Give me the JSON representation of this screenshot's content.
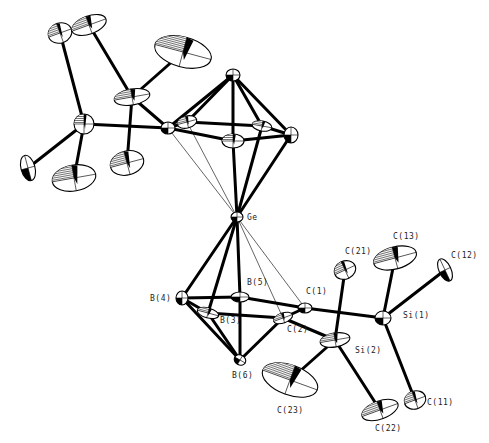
{
  "figure": {
    "title": "",
    "atoms": [
      {
        "id": "Ge",
        "label": "Ge",
        "x": 237,
        "y": 217,
        "rx": 6,
        "ry": 5,
        "rot": 0,
        "lx": 247,
        "ly": 220
      },
      {
        "id": "B4",
        "label": "B(4)",
        "x": 182,
        "y": 298,
        "rx": 6,
        "ry": 7,
        "rot": 0,
        "lx": 150,
        "ly": 301
      },
      {
        "id": "B5",
        "label": "B(5)",
        "x": 240,
        "y": 297,
        "rx": 9,
        "ry": 5,
        "rot": 0,
        "lx": 247,
        "ly": 285
      },
      {
        "id": "B3",
        "label": "B(3)",
        "x": 208,
        "y": 313,
        "rx": 11,
        "ry": 5,
        "rot": 15,
        "lx": 220,
        "ly": 323
      },
      {
        "id": "C1",
        "label": "C(1)",
        "x": 305,
        "y": 308,
        "rx": 7,
        "ry": 5,
        "rot": 0,
        "lx": 306,
        "ly": 294
      },
      {
        "id": "C2",
        "label": "C(2)",
        "x": 283,
        "y": 318,
        "rx": 10,
        "ry": 5,
        "rot": -20,
        "lx": 287,
        "ly": 332
      },
      {
        "id": "B6",
        "label": "B(6)",
        "x": 240,
        "y": 360,
        "rx": 6,
        "ry": 5,
        "rot": 30,
        "lx": 232,
        "ly": 378
      },
      {
        "id": "Si1",
        "label": "Si(1)",
        "x": 383,
        "y": 318,
        "rx": 8,
        "ry": 7,
        "rot": 0,
        "lx": 403,
        "ly": 318
      },
      {
        "id": "Si2",
        "label": "Si(2)",
        "x": 335,
        "y": 340,
        "rx": 15,
        "ry": 7,
        "rot": -10,
        "lx": 355,
        "ly": 353
      },
      {
        "id": "C21",
        "label": "C(21)",
        "x": 345,
        "y": 270,
        "rx": 11,
        "ry": 9,
        "rot": -25,
        "lx": 345,
        "ly": 254
      },
      {
        "id": "C13",
        "label": "C(13)",
        "x": 395,
        "y": 258,
        "rx": 22,
        "ry": 11,
        "rot": -15,
        "lx": 393,
        "ly": 239
      },
      {
        "id": "C12",
        "label": "C(12)",
        "x": 445,
        "y": 270,
        "rx": 6,
        "ry": 12,
        "rot": -25,
        "lx": 451,
        "ly": 258
      },
      {
        "id": "C11",
        "label": "C(11)",
        "x": 415,
        "y": 400,
        "rx": 11,
        "ry": 9,
        "rot": -20,
        "lx": 427,
        "ly": 405
      },
      {
        "id": "C22",
        "label": "C(22)",
        "x": 380,
        "y": 410,
        "rx": 19,
        "ry": 9,
        "rot": -20,
        "lx": 375,
        "ly": 431
      },
      {
        "id": "C23",
        "label": "C(23)",
        "x": 290,
        "y": 380,
        "rx": 29,
        "ry": 15,
        "rot": 20,
        "lx": 277,
        "ly": 413
      }
    ],
    "unlabeled_atoms": [
      {
        "id": "T_apex",
        "x": 233,
        "y": 75,
        "rx": 7,
        "ry": 6,
        "rot": 0
      },
      {
        "id": "T_left",
        "x": 168,
        "y": 128,
        "rx": 7,
        "ry": 6,
        "rot": 0
      },
      {
        "id": "T_backleft",
        "x": 187,
        "y": 122,
        "rx": 10,
        "ry": 6,
        "rot": -15
      },
      {
        "id": "T_front",
        "x": 233,
        "y": 141,
        "rx": 11,
        "ry": 7,
        "rot": 0
      },
      {
        "id": "T_backright",
        "x": 262,
        "y": 126,
        "rx": 10,
        "ry": 5,
        "rot": 10
      },
      {
        "id": "T_right",
        "x": 291,
        "y": 135,
        "rx": 7,
        "ry": 8,
        "rot": 0
      },
      {
        "id": "L_Si",
        "x": 84,
        "y": 124,
        "rx": 10,
        "ry": 10,
        "rot": 0
      },
      {
        "id": "U_Si",
        "x": 132,
        "y": 97,
        "rx": 18,
        "ry": 8,
        "rot": -10
      },
      {
        "id": "M1",
        "x": 60,
        "y": 33,
        "rx": 12,
        "ry": 10,
        "rot": -20
      },
      {
        "id": "M2",
        "x": 89,
        "y": 25,
        "rx": 18,
        "ry": 9,
        "rot": -20
      },
      {
        "id": "M3",
        "x": 183,
        "y": 52,
        "rx": 29,
        "ry": 15,
        "rot": 15
      },
      {
        "id": "M4",
        "x": 28,
        "y": 168,
        "rx": 7,
        "ry": 13,
        "rot": -15
      },
      {
        "id": "M5",
        "x": 74,
        "y": 178,
        "rx": 22,
        "ry": 13,
        "rot": -10
      },
      {
        "id": "M6",
        "x": 127,
        "y": 163,
        "rx": 17,
        "ry": 12,
        "rot": -15
      }
    ],
    "bonds": [
      [
        "T_apex",
        "T_left"
      ],
      [
        "T_apex",
        "T_backleft"
      ],
      [
        "T_apex",
        "T_front"
      ],
      [
        "T_apex",
        "T_backright"
      ],
      [
        "T_apex",
        "T_right"
      ],
      [
        "T_left",
        "T_backleft"
      ],
      [
        "T_left",
        "T_front"
      ],
      [
        "T_front",
        "T_right"
      ],
      [
        "T_backleft",
        "T_backright"
      ],
      [
        "T_backright",
        "T_right"
      ],
      [
        "Ge",
        "T_front"
      ],
      [
        "Ge",
        "T_backright"
      ],
      [
        "Ge",
        "T_right"
      ],
      [
        "T_left",
        "L_Si"
      ],
      [
        "T_left",
        "U_Si"
      ],
      [
        "L_Si",
        "M1"
      ],
      [
        "L_Si",
        "M4"
      ],
      [
        "L_Si",
        "M5"
      ],
      [
        "U_Si",
        "M2"
      ],
      [
        "U_Si",
        "M3"
      ],
      [
        "U_Si",
        "M6"
      ],
      [
        "Ge",
        "B4"
      ],
      [
        "Ge",
        "B5"
      ],
      [
        "Ge",
        "B3"
      ],
      [
        "B4",
        "B5"
      ],
      [
        "B4",
        "B3"
      ],
      [
        "B4",
        "B6"
      ],
      [
        "B3",
        "C2"
      ],
      [
        "B5",
        "C1"
      ],
      [
        "C1",
        "C2"
      ],
      [
        "B3",
        "B6"
      ],
      [
        "B5",
        "B6"
      ],
      [
        "C2",
        "B6"
      ],
      [
        "C1",
        "Si1"
      ],
      [
        "C2",
        "Si2"
      ],
      [
        "Si1",
        "C13"
      ],
      [
        "Si1",
        "C12"
      ],
      [
        "Si1",
        "C11"
      ],
      [
        "Si2",
        "C21"
      ],
      [
        "Si2",
        "C22"
      ],
      [
        "Si2",
        "C23"
      ]
    ],
    "thin_bonds": [
      [
        "Ge",
        "T_left"
      ],
      [
        "Ge",
        "T_backleft"
      ],
      [
        "Ge",
        "C1"
      ],
      [
        "Ge",
        "C2"
      ]
    ]
  }
}
